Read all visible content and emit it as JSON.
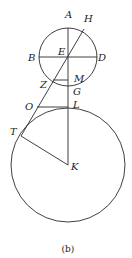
{
  "diagram": {
    "caption": "(b)",
    "labels": {
      "A": "A",
      "H": "H",
      "B": "B",
      "E": "E",
      "D": "D",
      "Z": "Z",
      "M": "M",
      "G": "G",
      "O": "O",
      "L": "L",
      "T": "T",
      "K": "K"
    },
    "shapes": {
      "small_circle": {
        "center": "E",
        "cx": 68,
        "cy": 57,
        "r": 29
      },
      "large_circle": {
        "center": "K",
        "cx": 68,
        "cy": 165,
        "r": 57
      },
      "segments": [
        "A-K vertical",
        "B-D horizontal",
        "H-T through E and O",
        "Z-M horizontal",
        "O-L horizontal",
        "T-K radius"
      ]
    }
  }
}
